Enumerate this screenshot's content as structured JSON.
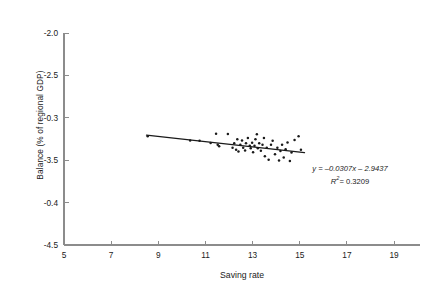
{
  "chart_data": {
    "type": "scatter",
    "title": "",
    "xlabel": "Saving rate",
    "ylabel": "Balance (% of regional GDP)",
    "xlim": [
      5,
      20.1
    ],
    "ylim": [
      -4.5,
      -2.0
    ],
    "grid": false,
    "legend": null,
    "xticks": [
      "5",
      "7",
      "9",
      "11",
      "13",
      "15",
      "17",
      "19"
    ],
    "xtick_values": [
      5,
      7,
      9,
      11,
      13,
      15,
      17,
      19
    ],
    "yticks": [
      "-2.0",
      "-2.5",
      "-0.3",
      "-3.5",
      "-0.4",
      "-4.5"
    ],
    "ytick_values": [
      -2.0,
      -2.5,
      -3.0,
      -3.5,
      -4.0,
      -4.5
    ],
    "marker": "dot",
    "marker_color": "#1a1a1a",
    "line_color": "#1a1a1a",
    "points": [
      [
        8.55,
        -3.218
      ],
      [
        10.35,
        -3.268
      ],
      [
        10.75,
        -3.272
      ],
      [
        11.22,
        -3.298
      ],
      [
        11.45,
        -3.188
      ],
      [
        11.52,
        -3.318
      ],
      [
        11.58,
        -3.336
      ],
      [
        11.95,
        -3.192
      ],
      [
        12.15,
        -3.352
      ],
      [
        12.22,
        -3.3
      ],
      [
        12.3,
        -3.378
      ],
      [
        12.35,
        -3.252
      ],
      [
        12.4,
        -3.398
      ],
      [
        12.48,
        -3.318
      ],
      [
        12.55,
        -3.268
      ],
      [
        12.6,
        -3.352
      ],
      [
        12.68,
        -3.385
      ],
      [
        12.72,
        -3.3
      ],
      [
        12.8,
        -3.238
      ],
      [
        12.88,
        -3.33
      ],
      [
        12.92,
        -3.36
      ],
      [
        12.98,
        -3.295
      ],
      [
        13.02,
        -3.405
      ],
      [
        13.08,
        -3.33
      ],
      [
        13.12,
        -3.252
      ],
      [
        13.18,
        -3.195
      ],
      [
        13.22,
        -3.358
      ],
      [
        13.28,
        -3.3
      ],
      [
        13.35,
        -3.388
      ],
      [
        13.42,
        -3.318
      ],
      [
        13.48,
        -3.238
      ],
      [
        13.52,
        -3.452
      ],
      [
        13.6,
        -3.352
      ],
      [
        13.68,
        -3.495
      ],
      [
        13.78,
        -3.318
      ],
      [
        13.85,
        -3.272
      ],
      [
        13.95,
        -3.43
      ],
      [
        14.05,
        -3.352
      ],
      [
        14.12,
        -3.505
      ],
      [
        14.18,
        -3.392
      ],
      [
        14.25,
        -3.318
      ],
      [
        14.32,
        -3.468
      ],
      [
        14.4,
        -3.372
      ],
      [
        14.48,
        -3.292
      ],
      [
        14.58,
        -3.508
      ],
      [
        14.65,
        -3.408
      ],
      [
        14.78,
        -3.262
      ],
      [
        14.95,
        -3.218
      ],
      [
        15.05,
        -3.378
      ]
    ],
    "trendline": {
      "equation": "y = –0.0307x – 2.9437",
      "slope": -0.0307,
      "intercept": -2.9437,
      "r_squared": 0.3209,
      "r_squared_label": "= 0.3209",
      "r_symbol": "R",
      "r_exponent": "2",
      "x_start": 8.5,
      "x_end": 15.2
    }
  }
}
